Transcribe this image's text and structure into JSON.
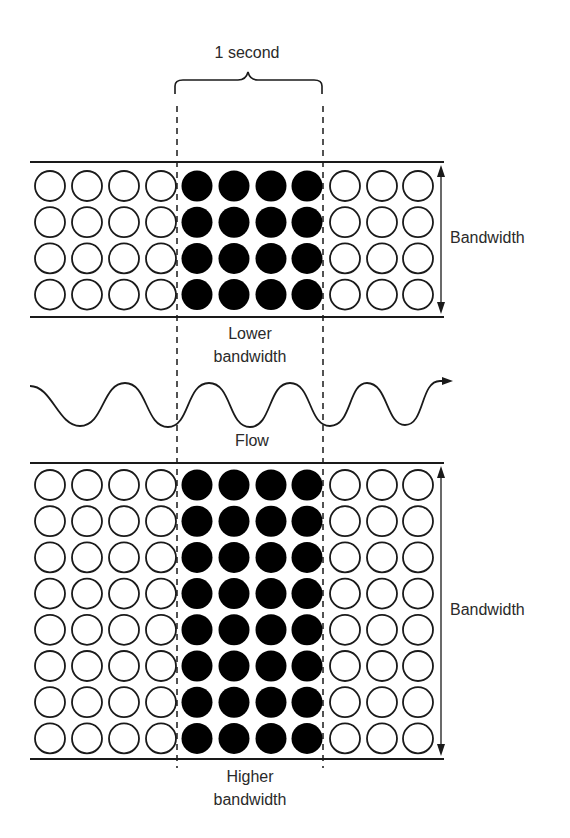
{
  "labels": {
    "interval": "1 second",
    "top_bandwidth": "Bandwidth",
    "lower_line1": "Lower",
    "lower_line2": "bandwidth",
    "flow": "Flow",
    "bottom_bandwidth": "Bandwidth",
    "higher_line1": "Higher",
    "higher_line2": "bandwidth"
  },
  "colors": {
    "stroke": "#1a1a1a",
    "filled": "#000000",
    "empty": "#ffffff",
    "text": "#2a2a2a"
  },
  "grid": {
    "columns": 11,
    "filled_columns": [
      4,
      5,
      6,
      7
    ],
    "top_rows": 4,
    "bottom_rows": 8
  },
  "icons": {
    "brace": "curly-brace-icon",
    "double_arrow": "double-arrow-icon",
    "wave_arrow": "wave-arrow-icon"
  }
}
